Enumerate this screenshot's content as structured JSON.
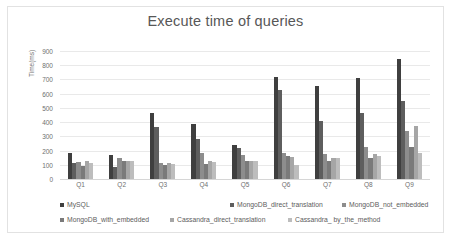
{
  "chart_data": {
    "type": "bar",
    "title": "Execute time of queries",
    "xlabel": "",
    "ylabel": "Time(ms)",
    "ylim": [
      0,
      900
    ],
    "ytick_step": 100,
    "yticks": [
      "900",
      "800",
      "700",
      "600",
      "500",
      "400",
      "300",
      "200",
      "100",
      "0"
    ],
    "grid": true,
    "legend_position": "bottom",
    "categories": [
      "Q1",
      "Q2",
      "Q3",
      "Q4",
      "Q5",
      "Q6",
      "Q7",
      "Q8",
      "Q9"
    ],
    "series": [
      {
        "name": "MySQL",
        "color": "#3f3f3f",
        "values": [
          180,
          170,
          465,
          390,
          240,
          720,
          655,
          710,
          845
        ]
      },
      {
        "name": "MongoDB_direct_translation",
        "color": "#5e5e5e",
        "values": [
          115,
          85,
          365,
          280,
          220,
          625,
          410,
          465,
          550
        ]
      },
      {
        "name": "MongoDB_not_embedded",
        "color": "#8d8d8d",
        "values": [
          120,
          150,
          115,
          180,
          170,
          180,
          175,
          225,
          335
        ]
      },
      {
        "name": "MongoDB_with_embedded",
        "color": "#7a7a7a",
        "values": [
          95,
          130,
          100,
          105,
          130,
          160,
          130,
          145,
          225
        ]
      },
      {
        "name": "Cassandra_direct_translation",
        "color": "#a6a6a6",
        "values": [
          125,
          125,
          115,
          125,
          125,
          155,
          145,
          175,
          370
        ]
      },
      {
        "name": "Cassandra_ by_the_method",
        "color": "#bdbdbd",
        "values": [
          110,
          125,
          105,
          120,
          125,
          100,
          145,
          160,
          180
        ]
      }
    ]
  },
  "legend": {
    "row1": [
      "MySQL",
      "MongoDB_direct_translation",
      "MongoDB_not_embedded"
    ],
    "row2": [
      "MongoDB_with_embedded",
      "Cassandra_direct_translation",
      "Cassandra_ by_the_method"
    ]
  }
}
